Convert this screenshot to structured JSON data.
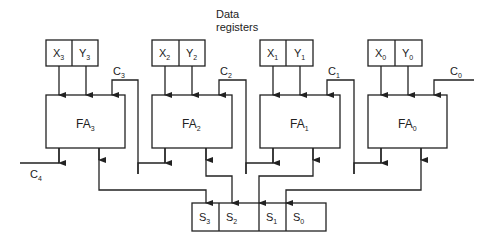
{
  "title_label": {
    "line1": "Data",
    "line2": "registers"
  },
  "colors": {
    "line": "#222222",
    "background": "#ffffff"
  },
  "stages": [
    {
      "x": {
        "base": "X",
        "sub": "3"
      },
      "y": {
        "base": "Y",
        "sub": "3"
      },
      "fa": {
        "base": "FA",
        "sub": "3"
      },
      "carry_in": {
        "base": "C",
        "sub": "3"
      }
    },
    {
      "x": {
        "base": "X",
        "sub": "2"
      },
      "y": {
        "base": "Y",
        "sub": "2"
      },
      "fa": {
        "base": "FA",
        "sub": "2"
      },
      "carry_in": {
        "base": "C",
        "sub": "2"
      }
    },
    {
      "x": {
        "base": "X",
        "sub": "1"
      },
      "y": {
        "base": "Y",
        "sub": "1"
      },
      "fa": {
        "base": "FA",
        "sub": "1"
      },
      "carry_in": {
        "base": "C",
        "sub": "1"
      }
    },
    {
      "x": {
        "base": "X",
        "sub": "0"
      },
      "y": {
        "base": "Y",
        "sub": "0"
      },
      "fa": {
        "base": "FA",
        "sub": "0"
      },
      "carry_in": {
        "base": "C",
        "sub": "0"
      }
    }
  ],
  "carry_out": {
    "base": "C",
    "sub": "4"
  },
  "sum_register": [
    {
      "base": "S",
      "sub": "3"
    },
    {
      "base": "S",
      "sub": "2"
    },
    {
      "base": "S",
      "sub": "1"
    },
    {
      "base": "S",
      "sub": "0"
    }
  ]
}
